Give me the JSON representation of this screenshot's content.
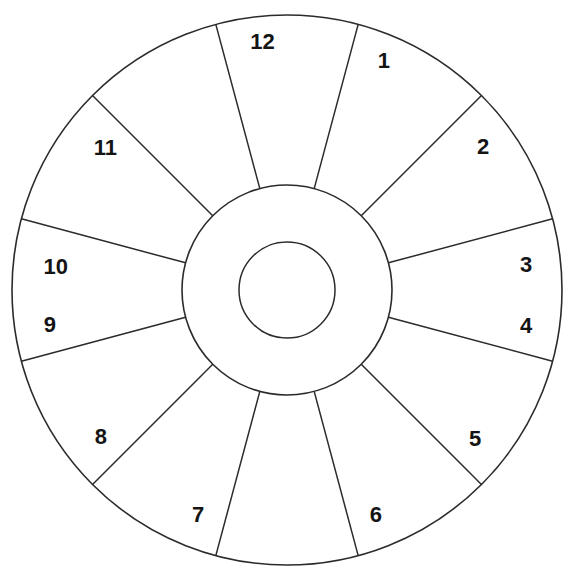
{
  "figure": {
    "kind": "radial-sector-wheel",
    "title": "",
    "background_color": "#ffffff",
    "line_color": "#2b2b2b",
    "label_color": "#141414"
  },
  "geometry": {
    "center_x": 287,
    "center_y": 290,
    "outer_radius": 275,
    "hub_radius": 105,
    "core_radius": 48,
    "sector_count": 12,
    "sector_span_degrees": 30,
    "spoke_offset_degrees": 15
  },
  "chart_data": {
    "type": "pie",
    "title": "",
    "xlabel": "",
    "ylabel": "",
    "legend_position": "none",
    "grid": false,
    "categories": [
      "1",
      "2",
      "3",
      "4",
      "5",
      "6",
      "7",
      "8",
      "9",
      "10",
      "11",
      "12"
    ],
    "values": [
      30,
      30,
      30,
      30,
      30,
      30,
      30,
      30,
      30,
      30,
      30,
      30
    ],
    "annotations": [
      "Twelve equal 30-degree sectors of an annulus",
      "Sector numbers run clockwise from the top",
      "Concentric inner hub ring and central core circle are undivided"
    ]
  },
  "sectors": [
    {
      "label": "1",
      "spoke_angle_deg": 15,
      "label_angle_deg": 22,
      "label_radius": 248,
      "label_dx": 4,
      "label_dy": 2
    },
    {
      "label": "2",
      "spoke_angle_deg": 45,
      "label_angle_deg": 53,
      "label_radius": 243,
      "label_dx": 2,
      "label_dy": 4
    },
    {
      "label": "3",
      "spoke_angle_deg": 75,
      "label_angle_deg": 83,
      "label_radius": 243,
      "label_dx": -2,
      "label_dy": 6
    },
    {
      "label": "4",
      "spoke_angle_deg": 105,
      "label_angle_deg": 97,
      "label_radius": 243,
      "label_dx": -2,
      "label_dy": 8
    },
    {
      "label": "5",
      "spoke_angle_deg": 135,
      "label_angle_deg": 127,
      "label_radius": 243,
      "label_dx": -6,
      "label_dy": 4
    },
    {
      "label": "6",
      "spoke_angle_deg": 165,
      "label_angle_deg": 157,
      "label_radius": 248,
      "label_dx": -8,
      "label_dy": -2
    },
    {
      "label": "7",
      "spoke_angle_deg": 195,
      "label_angle_deg": 203,
      "label_radius": 248,
      "label_dx": 8,
      "label_dy": -2
    },
    {
      "label": "8",
      "spoke_angle_deg": 225,
      "label_angle_deg": 233,
      "label_radius": 243,
      "label_dx": 8,
      "label_dy": 2
    },
    {
      "label": "9",
      "spoke_angle_deg": 255,
      "label_angle_deg": 263,
      "label_radius": 245,
      "label_dx": 6,
      "label_dy": 6
    },
    {
      "label": "10",
      "spoke_angle_deg": 285,
      "label_angle_deg": 277,
      "label_radius": 243,
      "label_dx": 10,
      "label_dy": 8
    },
    {
      "label": "11",
      "spoke_angle_deg": 315,
      "label_angle_deg": 307,
      "label_radius": 240,
      "label_dx": 10,
      "label_dy": 4
    },
    {
      "label": "12",
      "spoke_angle_deg": 345,
      "label_angle_deg": 352,
      "label_radius": 248,
      "label_dx": 10,
      "label_dy": -1
    }
  ]
}
